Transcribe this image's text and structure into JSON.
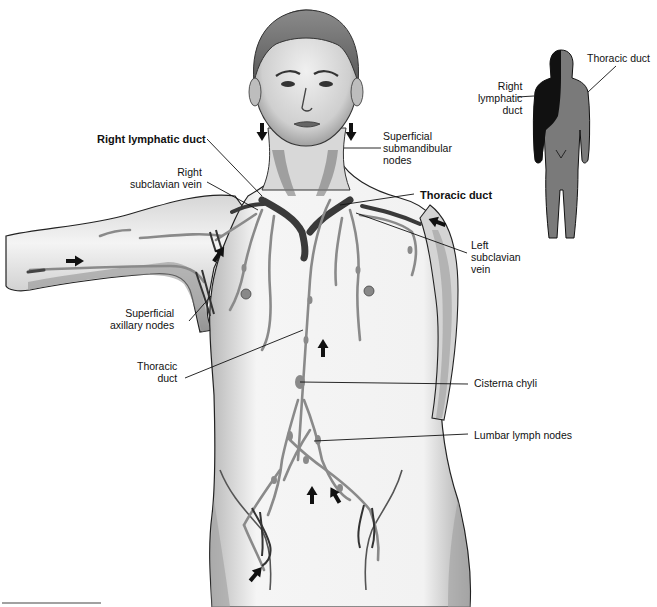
{
  "diagram": {
    "colors": {
      "skin_shade": "#9a9a9a",
      "lymph_vessel": "#8a8a8a",
      "vein_dark": "#3a3a3a",
      "arrow": "#111111",
      "inset_right_duct_region": "#111111",
      "inset_thoracic_duct_region": "#7a7a7a",
      "leader_line": "#111111"
    },
    "labels": [
      {
        "id": "right-lymphatic-duct",
        "text": "Right lymphatic duct",
        "bold": true,
        "x": 97,
        "y": 133,
        "align": "left",
        "leader": [
          [
            207,
            139
          ],
          [
            262,
            196
          ]
        ]
      },
      {
        "id": "right-subclavian-vein",
        "text": "Right\nsubclavian vein",
        "bold": false,
        "x": 130,
        "y": 166,
        "align": "right",
        "leader": [
          [
            207,
            182
          ],
          [
            258,
            210
          ]
        ]
      },
      {
        "id": "superficial-submandibular-nodes",
        "text": "Superficial\nsubmandibular\nnodes",
        "bold": false,
        "x": 383,
        "y": 130,
        "align": "left",
        "leader": [
          [
            381,
            148
          ],
          [
            344,
            148
          ]
        ]
      },
      {
        "id": "thoracic-duct-top",
        "text": "Thoracic duct",
        "bold": true,
        "x": 420,
        "y": 189,
        "align": "left",
        "leader": [
          [
            414,
            194
          ],
          [
            340,
            205
          ]
        ]
      },
      {
        "id": "left-subclavian-vein",
        "text": "Left\nsubclavian\nvein",
        "bold": false,
        "x": 471,
        "y": 239,
        "align": "left",
        "leader": [
          [
            467,
            253
          ],
          [
            356,
            213
          ]
        ]
      },
      {
        "id": "superficial-axillary-nodes",
        "text": "Superficial\naxillary nodes",
        "bold": false,
        "x": 110,
        "y": 307,
        "align": "right",
        "leader": [
          [
            189,
            321
          ],
          [
            211,
            296
          ]
        ]
      },
      {
        "id": "thoracic-duct-mid",
        "text": "Thoracic\nduct",
        "bold": false,
        "x": 137,
        "y": 360,
        "align": "right",
        "leader": [
          [
            185,
            378
          ],
          [
            303,
            330
          ]
        ]
      },
      {
        "id": "cisterna-chyli",
        "text": "Cisterna chyli",
        "bold": false,
        "x": 474,
        "y": 377,
        "align": "left",
        "leader": [
          [
            468,
            384
          ],
          [
            300,
            382
          ]
        ]
      },
      {
        "id": "lumbar-lymph-nodes",
        "text": "Lumbar lymph nodes",
        "bold": false,
        "x": 474,
        "y": 429,
        "align": "left",
        "leader": [
          [
            468,
            434
          ],
          [
            314,
            441
          ]
        ]
      }
    ],
    "inset": {
      "labels": [
        {
          "id": "inset-right-lymphatic-duct",
          "text": "Right\nlymphatic\nduct",
          "bold": false,
          "x": 478,
          "y": 80,
          "align": "right",
          "leader": [
            [
              517,
              97
            ],
            [
              534,
              96
            ]
          ]
        },
        {
          "id": "inset-thoracic-duct",
          "text": "Thoracic duct",
          "bold": false,
          "x": 587,
          "y": 52,
          "align": "left",
          "leader": [
            [
              616,
              66
            ],
            [
              588,
              92
            ]
          ]
        }
      ]
    },
    "flow_arrows": [
      {
        "x": 262,
        "y": 132,
        "angle": 90
      },
      {
        "x": 351,
        "y": 132,
        "angle": 90
      },
      {
        "x": 75,
        "y": 261,
        "angle": 0
      },
      {
        "x": 219,
        "y": 254,
        "angle": -55
      },
      {
        "x": 437,
        "y": 222,
        "angle": 200
      },
      {
        "x": 323,
        "y": 348,
        "angle": -90
      },
      {
        "x": 312,
        "y": 495,
        "angle": -90
      },
      {
        "x": 335,
        "y": 495,
        "angle": -120
      },
      {
        "x": 256,
        "y": 574,
        "angle": -50
      }
    ],
    "footer_rule": {
      "x1": 2,
      "x2": 101,
      "y": 603
    }
  }
}
